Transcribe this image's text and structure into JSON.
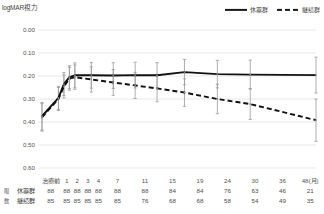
{
  "chart_data": {
    "type": "line",
    "title": "",
    "ylabel": "logMAR視力",
    "xlabel": "48(月)",
    "ylim": [
      0.0,
      0.6
    ],
    "y_inverted": true,
    "grid": true,
    "yticks": [
      "0.00",
      "0.10",
      "0.20",
      "0.30",
      "0.40",
      "0.50",
      "0.60"
    ],
    "ytick_values": [
      0.0,
      0.1,
      0.2,
      0.3,
      0.4,
      0.5,
      0.6
    ],
    "categories": [
      "治療前",
      "1",
      "2",
      "3",
      "4",
      "7",
      "11",
      "15",
      "19",
      "24",
      "30",
      "36",
      "48(月)"
    ],
    "x_values": [
      -2,
      1,
      2,
      3,
      4,
      7,
      11,
      15,
      19,
      24,
      30,
      36,
      48
    ],
    "legend_position": "top-right",
    "series": [
      {
        "name": "休薬群",
        "style": "solid",
        "values": [
          0.375,
          0.295,
          0.235,
          0.205,
          0.197,
          0.197,
          0.198,
          0.196,
          0.197,
          0.183,
          0.192,
          0.194,
          0.196
        ],
        "err_low": [
          0.315,
          0.245,
          0.185,
          0.155,
          0.143,
          0.141,
          0.142,
          0.14,
          0.142,
          0.128,
          0.132,
          0.131,
          0.118
        ],
        "err_high": [
          0.435,
          0.345,
          0.285,
          0.255,
          0.251,
          0.253,
          0.254,
          0.252,
          0.252,
          0.238,
          0.252,
          0.257,
          0.274
        ]
      },
      {
        "name": "継続群",
        "style": "dashed",
        "values": [
          0.38,
          0.3,
          0.245,
          0.212,
          0.205,
          0.215,
          0.228,
          0.241,
          0.254,
          0.272,
          0.3,
          0.322,
          0.392
        ],
        "err_low": [
          0.32,
          0.25,
          0.195,
          0.162,
          0.152,
          0.16,
          0.172,
          0.184,
          0.196,
          0.212,
          0.236,
          0.255,
          0.3
        ],
        "err_high": [
          0.44,
          0.35,
          0.295,
          0.262,
          0.258,
          0.27,
          0.284,
          0.298,
          0.312,
          0.332,
          0.364,
          0.389,
          0.484
        ]
      }
    ]
  },
  "legend": {
    "items": [
      {
        "label": "休薬群",
        "style": "solid"
      },
      {
        "label": "継続群",
        "style": "dashed"
      }
    ]
  },
  "axis": {
    "y_title": "logMAR視力"
  },
  "risk_table": {
    "side_caption": "眼数",
    "columns": [
      "治療前",
      "1",
      "2",
      "3",
      "4",
      "7",
      "11",
      "15",
      "19",
      "24",
      "30",
      "36",
      "48(月)"
    ],
    "rows": [
      {
        "label": "休薬群",
        "values": [
          "88",
          "88",
          "88",
          "88",
          "88",
          "88",
          "88",
          "84",
          "84",
          "76",
          "63",
          "46",
          "21"
        ]
      },
      {
        "label": "継続群",
        "values": [
          "85",
          "85",
          "85",
          "85",
          "85",
          "85",
          "76",
          "68",
          "68",
          "58",
          "54",
          "49",
          "35"
        ]
      }
    ]
  }
}
